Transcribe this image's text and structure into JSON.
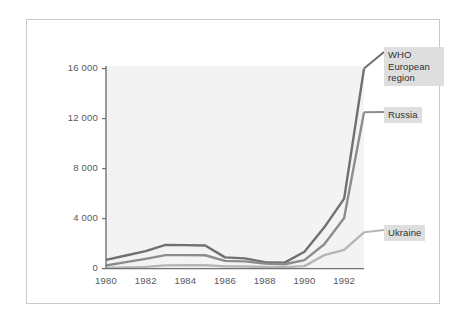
{
  "figure": {
    "background": "#ffffff",
    "frame_border_color": "#c9c9c9",
    "plot_background": "#f3f3f3"
  },
  "chart_data": {
    "type": "line",
    "title": "",
    "subtitle": "",
    "xlabel": "",
    "ylabel": "",
    "xlim": [
      1980,
      1993
    ],
    "ylim": [
      0,
      16500
    ],
    "grid": false,
    "legend_position": "right-inline-labels",
    "x": [
      1980,
      1981,
      1982,
      1983,
      1984,
      1985,
      1986,
      1987,
      1988,
      1989,
      1990,
      1991,
      1992,
      1993
    ],
    "xticks": [
      1980,
      1982,
      1984,
      1986,
      1988,
      1990,
      1992
    ],
    "xtick_labels": [
      "1980",
      "1982",
      "1984",
      "1986",
      "1988",
      "1990",
      "1992"
    ],
    "yticks": [
      0,
      4000,
      8000,
      12000,
      16000
    ],
    "ytick_labels": [
      "0",
      "4000",
      "8000",
      "12000",
      "16000"
    ],
    "series": [
      {
        "name": "WHO European region",
        "label": "WHO\nEuropean\nregion",
        "color": "#6e7072",
        "values": [
          700,
          1050,
          1400,
          1900,
          1880,
          1850,
          900,
          820,
          520,
          480,
          1350,
          3300,
          5600,
          16000
        ]
      },
      {
        "name": "Russia",
        "label": "Russia",
        "color": "#8a8c8e",
        "values": [
          250,
          520,
          780,
          1080,
          1080,
          1070,
          620,
          580,
          400,
          350,
          680,
          1950,
          4050,
          12500
        ]
      },
      {
        "name": "Ukraine",
        "label": "Ukraine",
        "color": "#b4b6b8",
        "values": [
          60,
          90,
          140,
          260,
          270,
          270,
          180,
          170,
          130,
          120,
          200,
          1080,
          1500,
          2900
        ]
      }
    ]
  }
}
